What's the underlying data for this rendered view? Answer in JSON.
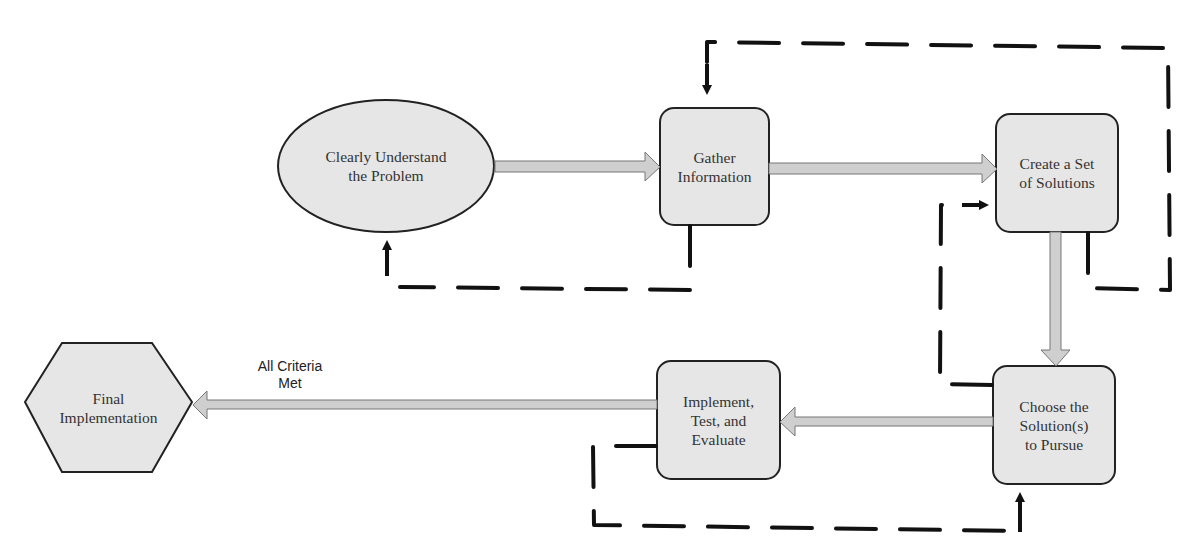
{
  "diagram": {
    "type": "flowchart",
    "nodes": [
      {
        "id": "understand",
        "shape": "ellipse",
        "label": "Clearly Understand\nthe Problem"
      },
      {
        "id": "gather",
        "shape": "rounded-rect",
        "label": "Gather\nInformation"
      },
      {
        "id": "create",
        "shape": "rounded-rect",
        "label": "Create a Set\nof Solutions"
      },
      {
        "id": "choose",
        "shape": "rounded-rect",
        "label": "Choose the\nSolution(s)\nto Pursue"
      },
      {
        "id": "implement",
        "shape": "rounded-rect",
        "label": "Implement,\nTest, and\nEvaluate"
      },
      {
        "id": "final",
        "shape": "hexagon",
        "label": "Final\nImplementation"
      }
    ],
    "edges": [
      {
        "from": "understand",
        "to": "gather",
        "style": "solid-block-arrow"
      },
      {
        "from": "gather",
        "to": "create",
        "style": "solid-block-arrow"
      },
      {
        "from": "create",
        "to": "choose",
        "style": "solid-block-arrow"
      },
      {
        "from": "choose",
        "to": "implement",
        "style": "solid-block-arrow"
      },
      {
        "from": "implement",
        "to": "final",
        "style": "solid-block-arrow",
        "label": "All Criteria\nMet"
      },
      {
        "from": "gather",
        "to": "understand",
        "style": "dashed-feedback"
      },
      {
        "from": "create",
        "to": "gather",
        "style": "dashed-feedback"
      },
      {
        "from": "choose",
        "to": "create",
        "style": "dashed-feedback"
      },
      {
        "from": "implement",
        "to": "choose",
        "style": "dashed-feedback"
      }
    ],
    "colors": {
      "node_fill": "#e6e6e6",
      "node_stroke": "#222222",
      "arrow_fill": "#cfcfcf",
      "dash": "#111111"
    }
  }
}
